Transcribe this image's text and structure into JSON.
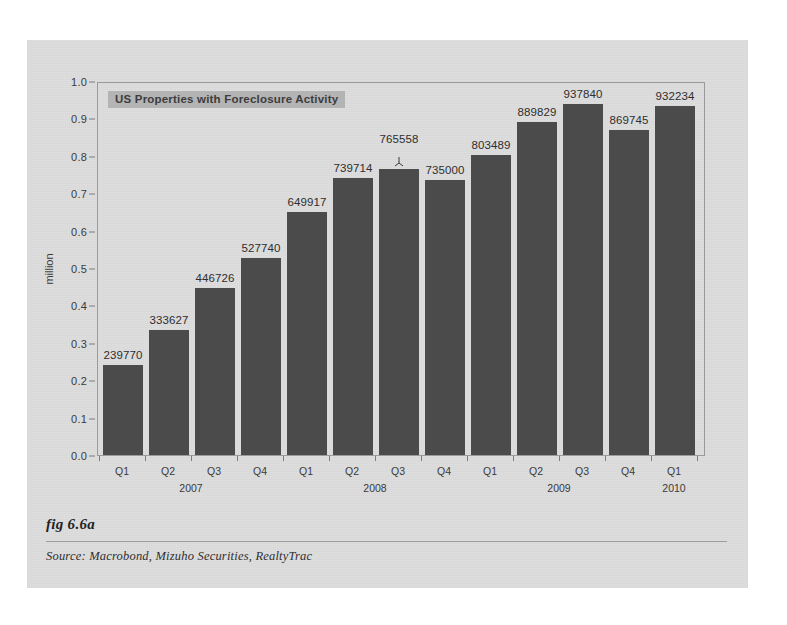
{
  "figure": {
    "fig_label": "fig 6.6a",
    "source": "Source:  Macrobond, Mizuho Securities, RealtyTrac"
  },
  "chart_data": {
    "type": "bar",
    "title": "US Properties with Foreclosure Activity",
    "xlabel": "",
    "ylabel": "million",
    "ylim": [
      0.0,
      1.0
    ],
    "grid": false,
    "legend_position": "top-left-inside",
    "bar_color": "#4b4b4b",
    "legend_bg_color": "#b4b4b4",
    "y_ticks": [
      "0.0",
      "0.1",
      "0.2",
      "0.3",
      "0.4",
      "0.5",
      "0.6",
      "0.7",
      "0.8",
      "0.9",
      "1.0"
    ],
    "y_tick_values": [
      0.0,
      0.1,
      0.2,
      0.3,
      0.4,
      0.5,
      0.6,
      0.7,
      0.8,
      0.9,
      1.0
    ],
    "categories": [
      "Q1",
      "Q2",
      "Q3",
      "Q4",
      "Q1",
      "Q2",
      "Q3",
      "Q4",
      "Q1",
      "Q2",
      "Q3",
      "Q4",
      "Q1"
    ],
    "years": [
      {
        "label": "2007",
        "start_index": 0,
        "end_index": 3
      },
      {
        "label": "2008",
        "start_index": 4,
        "end_index": 7
      },
      {
        "label": "2009",
        "start_index": 8,
        "end_index": 11
      },
      {
        "label": "2010",
        "start_index": 12,
        "end_index": 12
      }
    ],
    "values": [
      239770,
      333627,
      446726,
      527740,
      649917,
      739714,
      765558,
      735000,
      803489,
      889829,
      937840,
      869745,
      932234
    ],
    "value_labels": [
      "239770",
      "333627",
      "446726",
      "527740",
      "649917",
      "739714",
      "765558",
      "735000",
      "803489",
      "889829",
      "937840",
      "869745",
      "932234"
    ],
    "markers": [
      {
        "index": 6,
        "type": "leader-pointer"
      }
    ]
  }
}
